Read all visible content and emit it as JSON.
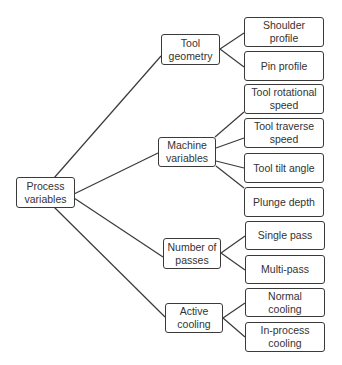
{
  "diagram": {
    "type": "tree",
    "root": {
      "label": "Process\nvariables"
    },
    "categories": [
      {
        "label": "Tool\ngeometry",
        "children": [
          "Shoulder\nprofile",
          "Pin profile"
        ]
      },
      {
        "label": "Machine\nvariables",
        "children": [
          "Tool rotational\nspeed",
          "Tool traverse\nspeed",
          "Tool tilt angle",
          "Plunge depth"
        ]
      },
      {
        "label": "Number of\npasses",
        "children": [
          "Single pass",
          "Multi-pass"
        ]
      },
      {
        "label": "Active\ncooling",
        "children": [
          "Normal\ncooling",
          "In-process\ncooling"
        ]
      }
    ]
  }
}
